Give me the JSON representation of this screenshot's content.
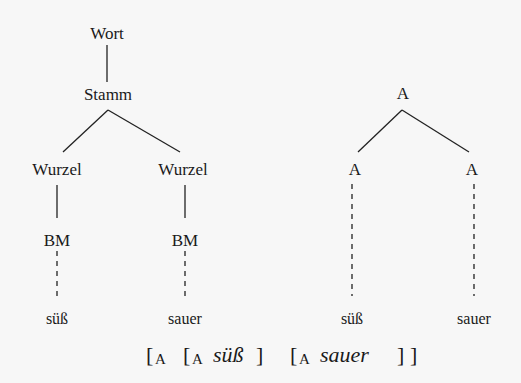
{
  "left_tree": {
    "root": "Wort",
    "stem": "Stamm",
    "roots": [
      "Wurzel",
      "Wurzel"
    ],
    "morphemes": [
      "BM",
      "BM"
    ],
    "leaves": [
      "süß",
      "sauer"
    ]
  },
  "right_tree": {
    "root": "A",
    "children": [
      "A",
      "A"
    ],
    "leaves": [
      "süß",
      "sauer"
    ]
  },
  "formula": {
    "open_outer": "[",
    "cat_outer": "A",
    "open_1": "[",
    "cat_1": "A",
    "word_1": "süß",
    "close_1": "]",
    "open_2": "[",
    "cat_2": "A",
    "word_2": "sauer",
    "close_2": "]",
    "close_outer": "]"
  }
}
